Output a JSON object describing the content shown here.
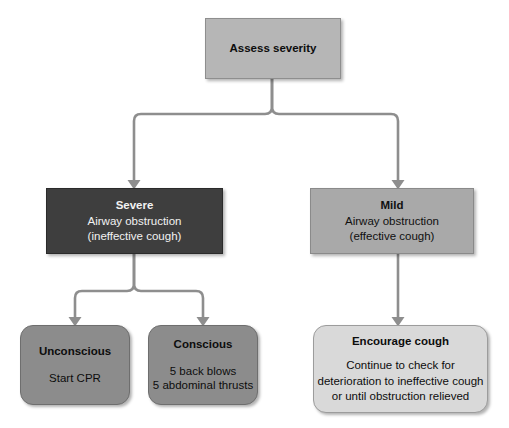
{
  "diagram": {
    "palette": {
      "canvas": "#ffffff",
      "connector": "#8e8e8e",
      "assess_fill": "#b6b6b6",
      "severe_fill": "#3e3e3e",
      "mild_fill": "#a9a9a9",
      "action_fill": "#8c8c8c",
      "encourage_fill": "#d9d9d9",
      "dark_text": "#0d0d0d",
      "light_text": "#f2f2f2"
    },
    "nodes": {
      "assess": {
        "title": "Assess severity",
        "lines": []
      },
      "severe": {
        "title": "Severe",
        "lines": [
          "Airway obstruction",
          "(ineffective cough)"
        ]
      },
      "mild": {
        "title": "Mild",
        "lines": [
          "Airway obstruction",
          "(effective cough)"
        ]
      },
      "unconscious": {
        "title": "Unconscious",
        "lines": [
          "Start CPR"
        ]
      },
      "conscious": {
        "title": "Conscious",
        "lines": [
          "5 back blows",
          "5 abdominal thrusts"
        ]
      },
      "encourage": {
        "title": "Encourage cough",
        "lines": [
          "Continue to check for",
          "deterioration to ineffective cough",
          "or until obstruction relieved"
        ]
      }
    },
    "edges": [
      {
        "from": "assess",
        "to": "severe",
        "arrow": true
      },
      {
        "from": "assess",
        "to": "mild",
        "arrow": true
      },
      {
        "from": "severe",
        "to": "unconscious",
        "arrow": true
      },
      {
        "from": "severe",
        "to": "conscious",
        "arrow": true
      },
      {
        "from": "mild",
        "to": "encourage",
        "arrow": true
      }
    ]
  }
}
